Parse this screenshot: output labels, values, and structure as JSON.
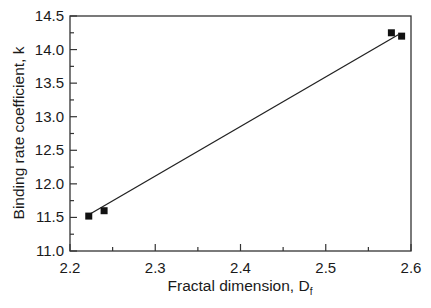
{
  "chart_data": {
    "type": "scatter",
    "title": "",
    "xlabel": "Fractal dimension, D",
    "xlabel_subscript": "f",
    "ylabel": "Binding rate coefficient, k",
    "xlim": [
      2.2,
      2.6
    ],
    "ylim": [
      11.0,
      14.5
    ],
    "xticks": [
      2.2,
      2.3,
      2.4,
      2.5,
      2.6
    ],
    "xtick_labels": [
      "2.2",
      "2.3",
      "2.4",
      "2.5",
      "2.6"
    ],
    "xminor_step": 0.05,
    "yticks": [
      11.0,
      11.5,
      12.0,
      12.5,
      13.0,
      13.5,
      14.0,
      14.5
    ],
    "ytick_labels": [
      "11.0",
      "11.5",
      "12.0",
      "12.5",
      "13.0",
      "13.5",
      "14.0",
      "14.5"
    ],
    "yminor_step": 0.25,
    "grid": false,
    "legend": null,
    "series": [
      {
        "name": "data",
        "marker": "square",
        "x": [
          2.222,
          2.24,
          2.577,
          2.589
        ],
        "y": [
          11.52,
          11.6,
          14.25,
          14.2
        ]
      },
      {
        "name": "fit",
        "type": "line",
        "x": [
          2.222,
          2.585
        ],
        "y": [
          11.54,
          14.22
        ]
      }
    ]
  },
  "colors": {
    "axis": "#333333",
    "marker": "#111111",
    "line": "#222222"
  }
}
